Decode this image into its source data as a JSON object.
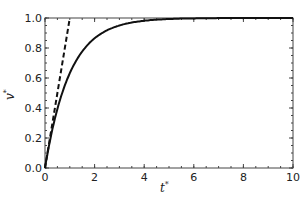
{
  "chart_data": {
    "type": "line",
    "title": "",
    "xlabel": "t*",
    "ylabel": "v*",
    "xlim": [
      0,
      10
    ],
    "ylim": [
      0,
      1.0
    ],
    "xticks": [
      "0",
      "2",
      "4",
      "6",
      "8",
      "10"
    ],
    "yticks": [
      "0.0",
      "0.2",
      "0.4",
      "0.6",
      "0.8",
      "1.0"
    ],
    "grid": false,
    "legend": null,
    "series": [
      {
        "name": "v* = 1 - exp(-t*)",
        "style": "solid",
        "x": [
          0,
          0.5,
          1,
          1.5,
          2,
          3,
          4,
          5,
          6,
          8,
          10
        ],
        "y": [
          0,
          0.39,
          0.63,
          0.78,
          0.86,
          0.95,
          0.98,
          0.99,
          1.0,
          1.0,
          1.0
        ]
      },
      {
        "name": "initial tangent v* = t*",
        "style": "dashed",
        "x": [
          0,
          1.0
        ],
        "y": [
          0,
          1.0
        ]
      }
    ]
  },
  "axes": {
    "x_label_main": "t",
    "x_label_sup": "*",
    "y_label_main": "v",
    "y_label_sup": "*",
    "xticks": [
      "0",
      "2",
      "4",
      "6",
      "8",
      "10"
    ],
    "yticks": [
      "0.0",
      "0.2",
      "0.4",
      "0.6",
      "0.8",
      "1.0"
    ]
  }
}
